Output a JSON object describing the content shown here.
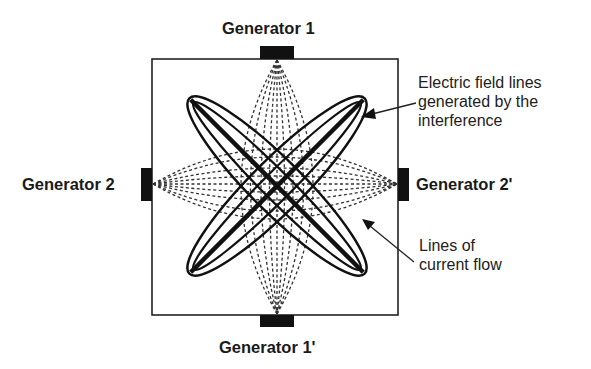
{
  "diagram": {
    "generators": {
      "top": "Generator 1",
      "bottom": "Generator 1'",
      "left": "Generator 2",
      "right": "Generator 2'"
    },
    "annotations": {
      "field_lines": [
        "Electric field lines",
        "generated by the",
        "interference"
      ],
      "current_lines": [
        "Lines of",
        "current flow"
      ]
    },
    "colors": {
      "ink": "#111111",
      "background": "#ffffff"
    }
  }
}
